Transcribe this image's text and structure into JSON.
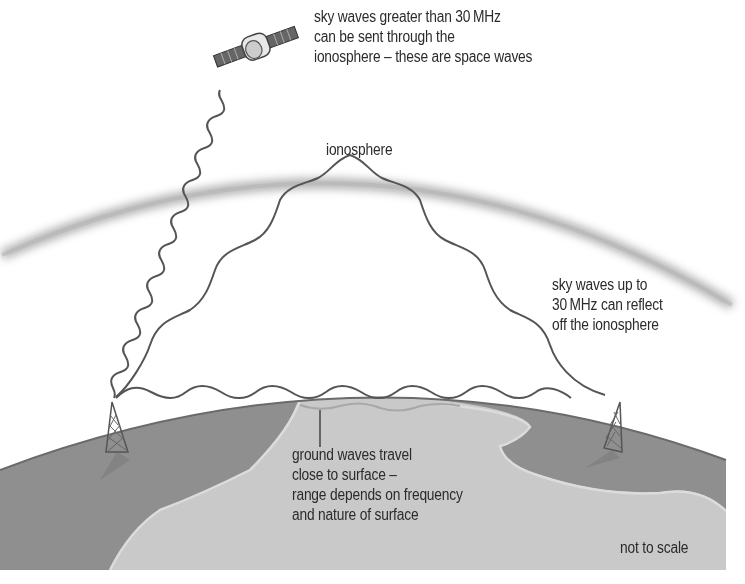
{
  "diagram": {
    "labels": {
      "space_waves": [
        "sky waves greater than 30 MHz",
        "can be sent through the",
        "ionosphere – these are space waves"
      ],
      "ionosphere": "ionosphere",
      "sky_waves": [
        "sky waves up to",
        "30 MHz can reflect",
        "off the ionosphere"
      ],
      "ground_waves": [
        "ground waves travel",
        "close to surface –",
        "range depends on frequency",
        "and nature of surface"
      ],
      "scale_note": "not to scale"
    },
    "elements": {
      "satellite": "satellite-icon",
      "transmitter_left": "radio-mast-icon",
      "transmitter_right": "radio-mast-icon",
      "ionosphere_band": "ionosphere-layer",
      "earth": "earth-surface"
    },
    "colors": {
      "background": "#ffffff",
      "wave_line": "#555555",
      "ionosphere_band": "#9a9a9a",
      "land_dark": "#8f8f8f",
      "land_light": "#c9c9c9",
      "coast_line": "#d8d8d8",
      "earth_outline": "#6a6a6a",
      "text": "#2b2b2b"
    }
  }
}
